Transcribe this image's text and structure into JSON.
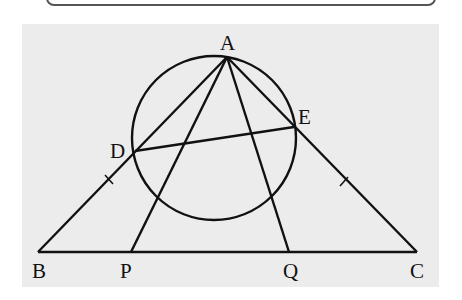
{
  "figure": {
    "type": "geometry",
    "points": {
      "A": {
        "label": "A",
        "x": 227,
        "y": 57
      },
      "B": {
        "label": "B",
        "x": 38,
        "y": 252
      },
      "C": {
        "label": "C",
        "x": 417,
        "y": 252
      },
      "D": {
        "label": "D",
        "x": 135,
        "y": 151
      },
      "E": {
        "label": "E",
        "x": 294,
        "y": 127
      },
      "P": {
        "label": "P",
        "x": 131,
        "y": 252
      },
      "Q": {
        "label": "Q",
        "x": 289,
        "y": 252
      }
    },
    "circle": {
      "cx": 214,
      "cy": 138,
      "r": 82
    },
    "segments": [
      "AB",
      "AC",
      "BC",
      "AP",
      "AQ",
      "DE"
    ],
    "tick_marks": [
      "BD",
      "EC"
    ],
    "stroke_color": "#111111",
    "background_color": "#ececec"
  }
}
